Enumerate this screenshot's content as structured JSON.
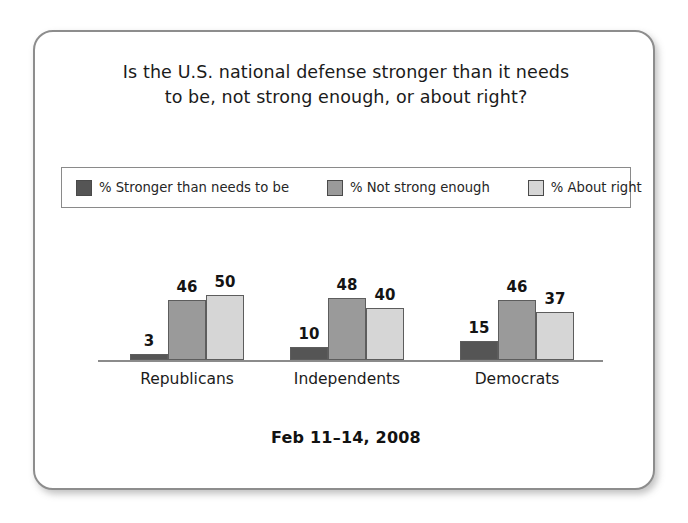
{
  "card": {
    "title_line1": "Is the U.S. national defense stronger than it needs",
    "title_line2": "to be, not strong enough, or about right?",
    "footer": "Feb 11–14, 2008"
  },
  "legend": {
    "items": [
      {
        "label": "% Stronger than needs to be",
        "color": "#555555"
      },
      {
        "label": "% Not strong enough",
        "color": "#9a9a9a"
      },
      {
        "label": "% About right",
        "color": "#d6d6d6"
      }
    ]
  },
  "chart_data": {
    "type": "bar",
    "title": "Is the U.S. national defense stronger than it needs to be, not strong enough, or about right?",
    "subtitle": "Feb 11–14, 2008",
    "xlabel": "",
    "ylabel": "",
    "ylim": [
      0,
      55
    ],
    "grid": false,
    "legend_position": "top",
    "categories": [
      "Republicans",
      "Independents",
      "Democrats"
    ],
    "series": [
      {
        "name": "% Stronger than needs to be",
        "color": "#555555",
        "values": [
          3,
          10,
          15
        ]
      },
      {
        "name": "% Not strong enough",
        "color": "#9a9a9a",
        "values": [
          46,
          48,
          46
        ]
      },
      {
        "name": "% About right",
        "color": "#d6d6d6",
        "values": [
          50,
          40,
          37
        ]
      }
    ]
  }
}
